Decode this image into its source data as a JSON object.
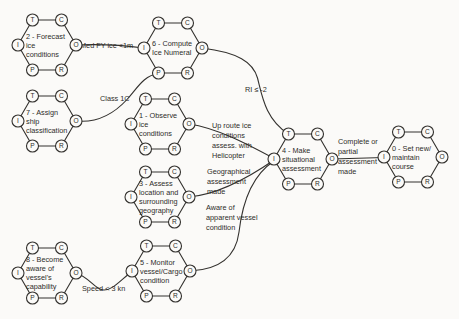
{
  "diagram": {
    "type": "FRAM-function-network",
    "ink_color": "#33312e",
    "paper_color": "#fbfaf8",
    "node_fill": "#fbfaf8",
    "port_letters": {
      "T": "T",
      "C": "C",
      "I": "I",
      "O": "O",
      "P": "P",
      "R": "R"
    },
    "nodes": [
      {
        "id": "2",
        "label": "2 - Forecast ice conditions",
        "lines": [
          "2 - Forecast",
          "ice",
          "conditions"
        ],
        "cx": 47,
        "cy": 45
      },
      {
        "id": "6",
        "label": "6 - Compute Ice Numeral",
        "lines": [
          "6 - Compute",
          "Ice Numeral"
        ],
        "cx": 173,
        "cy": 48
      },
      {
        "id": "7",
        "label": "7 - Assign ship classification",
        "lines": [
          "7 - Assign",
          "ship",
          "classification"
        ],
        "cx": 47,
        "cy": 121
      },
      {
        "id": "1",
        "label": "1 - Observe ice conditions",
        "lines": [
          "1 - Observe",
          "ice",
          "conditions"
        ],
        "cx": 160,
        "cy": 124
      },
      {
        "id": "3",
        "label": "3 - Assess location and surrounding geography",
        "lines": [
          "3 - Assess",
          "location and",
          "surrounding",
          "geography"
        ],
        "cx": 160,
        "cy": 197
      },
      {
        "id": "5",
        "label": "5 - Monitor vessel/Cargo condition",
        "lines": [
          "5 - Monitor",
          "vessel/Cargo",
          "condition"
        ],
        "cx": 161,
        "cy": 271
      },
      {
        "id": "8",
        "label": "8 - Become aware of vessel's capability",
        "lines": [
          "8 - Become",
          "aware of",
          "vessel's",
          "capability"
        ],
        "cx": 47,
        "cy": 273
      },
      {
        "id": "4",
        "label": "4 - Make situational assessment",
        "lines": [
          "4 - Make",
          "situational",
          "assessment"
        ],
        "cx": 303,
        "cy": 159
      },
      {
        "id": "0",
        "label": "0 - Set new/maintain course",
        "lines": [
          "0 - Set new/",
          "maintain",
          "course"
        ],
        "cx": 413,
        "cy": 157
      }
    ],
    "connections": [
      {
        "from": "2.O",
        "to": "6.I",
        "label": "Med FY ice <1m",
        "label_lines": [
          "Med FY ice <1m"
        ],
        "label_x": 80,
        "label_y": 47.5,
        "path": "M76,45 C100,44 122,45 144,48"
      },
      {
        "from": "7.O",
        "to": "6.P",
        "label": "Class 1C",
        "label_lines": [
          "Class 1C"
        ],
        "label_x": 100,
        "label_y": 101,
        "path": "M76,121 C100,123.5 115.5,112 127,99.5 C137,88.5 143.5,75.5 158.5,73.5"
      },
      {
        "from": "6.O",
        "to": "4.T",
        "label": "RI ≤ -2",
        "label_lines": [
          "RI ≤ -2"
        ],
        "label_x": 245,
        "label_y": 92,
        "path": "M202,48 C238,52.5 253,62 257.5,78 C262,95 265,119 288.5,134"
      },
      {
        "from": "1.O",
        "to": "4.I",
        "label": "Up route ice conditions assess. with Helicopter",
        "label_lines": [
          "Up route ice",
          "conditions",
          "assess. with",
          "Helicopter"
        ],
        "label_x": 212,
        "label_y": 128,
        "path": "M189,124 C217,128 247,144 274,158.5"
      },
      {
        "from": "3.O",
        "to": "4.I",
        "label": "Geographical assessment made",
        "label_lines": [
          "Geographical",
          "assessment",
          "made"
        ],
        "label_x": 207,
        "label_y": 174,
        "path": "M189,197 C221,194 251,176 274,160"
      },
      {
        "from": "5.O",
        "to": "4.I",
        "label": "Aware of apparent vessel condition",
        "label_lines": [
          "Aware of",
          "apparent vessel",
          "condition"
        ],
        "label_x": 206,
        "label_y": 210,
        "path": "M190,271 C224,269.5 236.5,252 239,232 C242,206 251,176 274,161"
      },
      {
        "from": "8.O",
        "to": "5.I",
        "label": "Speed < 3 kn",
        "label_lines": [
          "Speed < 3 kn"
        ],
        "label_x": 82,
        "label_y": 291,
        "path": "M76,273 C90,277.5 94.5,289.5 103.5,290 C112.5,290.5 120,280.5 132,271.5"
      },
      {
        "from": "4.O",
        "to": "0.I",
        "label": "Complete or partial assessment made",
        "label_lines": [
          "Complete or",
          "partial",
          "assessment",
          "made"
        ],
        "label_x": 338,
        "label_y": 144,
        "path": "M332,159 L384,157.5"
      }
    ]
  }
}
